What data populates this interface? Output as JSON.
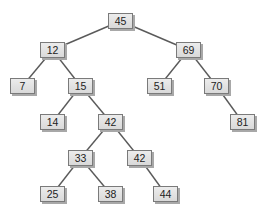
{
  "diagram": {
    "type": "binary-search-tree",
    "nodes": [
      {
        "id": "n45",
        "value": "45",
        "x": 108,
        "y": 13
      },
      {
        "id": "n12",
        "value": "12",
        "x": 40,
        "y": 42
      },
      {
        "id": "n69",
        "value": "69",
        "x": 176,
        "y": 42
      },
      {
        "id": "n7",
        "value": "7",
        "x": 10,
        "y": 78
      },
      {
        "id": "n15",
        "value": "15",
        "x": 68,
        "y": 78
      },
      {
        "id": "n51",
        "value": "51",
        "x": 147,
        "y": 78
      },
      {
        "id": "n70",
        "value": "70",
        "x": 204,
        "y": 78
      },
      {
        "id": "n14",
        "value": "14",
        "x": 40,
        "y": 114
      },
      {
        "id": "n42a",
        "value": "42",
        "x": 98,
        "y": 114
      },
      {
        "id": "n81",
        "value": "81",
        "x": 230,
        "y": 114
      },
      {
        "id": "n33",
        "value": "33",
        "x": 68,
        "y": 150
      },
      {
        "id": "n42b",
        "value": "42",
        "x": 127,
        "y": 150
      },
      {
        "id": "n25",
        "value": "25",
        "x": 40,
        "y": 186
      },
      {
        "id": "n38",
        "value": "38",
        "x": 98,
        "y": 186
      },
      {
        "id": "n44",
        "value": "44",
        "x": 153,
        "y": 186
      }
    ],
    "edges": [
      [
        "n45",
        "n12"
      ],
      [
        "n45",
        "n69"
      ],
      [
        "n12",
        "n7"
      ],
      [
        "n12",
        "n15"
      ],
      [
        "n69",
        "n51"
      ],
      [
        "n69",
        "n70"
      ],
      [
        "n15",
        "n14"
      ],
      [
        "n15",
        "n42a"
      ],
      [
        "n70",
        "n81"
      ],
      [
        "n42a",
        "n33"
      ],
      [
        "n42a",
        "n42b"
      ],
      [
        "n33",
        "n25"
      ],
      [
        "n33",
        "n38"
      ],
      [
        "n42b",
        "n44"
      ]
    ]
  }
}
